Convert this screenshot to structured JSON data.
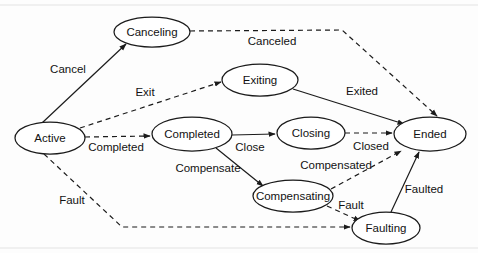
{
  "diagram": {
    "type": "state-machine",
    "background_color": "#fdfdfd",
    "stroke_color": "#1b1b1b",
    "text_color": "#121212",
    "nodes": [
      {
        "id": "active",
        "label": "Active",
        "cx": 50,
        "cy": 138,
        "rx": 35,
        "ry": 16
      },
      {
        "id": "canceling",
        "label": "Canceling",
        "cx": 152,
        "cy": 32,
        "rx": 38,
        "ry": 15
      },
      {
        "id": "exiting",
        "label": "Exiting",
        "cx": 260,
        "cy": 80,
        "rx": 38,
        "ry": 16
      },
      {
        "id": "completed",
        "label": "Completed",
        "cx": 192,
        "cy": 134,
        "rx": 40,
        "ry": 17
      },
      {
        "id": "closing",
        "label": "Closing",
        "cx": 311,
        "cy": 133,
        "rx": 34,
        "ry": 16
      },
      {
        "id": "ended",
        "label": "Ended",
        "cx": 430,
        "cy": 134,
        "rx": 36,
        "ry": 17
      },
      {
        "id": "compensating",
        "label": "Compensating",
        "cx": 293,
        "cy": 196,
        "rx": 40,
        "ry": 16
      },
      {
        "id": "faulting",
        "label": "Faulting",
        "cx": 386,
        "cy": 228,
        "rx": 34,
        "ry": 16
      }
    ],
    "edges": [
      {
        "id": "cancel",
        "label": "Cancel",
        "from": "active",
        "to": "canceling",
        "style": "solid",
        "label_x": 68,
        "label_y": 70
      },
      {
        "id": "canceled",
        "label": "Canceled",
        "from": "canceling",
        "to": "ended",
        "style": "dashed",
        "label_x": 272,
        "label_y": 42
      },
      {
        "id": "exit",
        "label": "Exit",
        "from": "active",
        "to": "exiting",
        "style": "dashed",
        "label_x": 145,
        "label_y": 93
      },
      {
        "id": "exited",
        "label": "Exited",
        "from": "exiting",
        "to": "ended",
        "style": "solid",
        "label_x": 362,
        "label_y": 92
      },
      {
        "id": "completed",
        "label": "Completed",
        "from": "active",
        "to": "completed",
        "style": "dashed",
        "label_x": 116,
        "label_y": 148
      },
      {
        "id": "close",
        "label": "Close",
        "from": "completed",
        "to": "closing",
        "style": "solid",
        "label_x": 250,
        "label_y": 148
      },
      {
        "id": "closed",
        "label": "Closed",
        "from": "closing",
        "to": "ended",
        "style": "dashed",
        "label_x": 371,
        "label_y": 147
      },
      {
        "id": "compensate",
        "label": "Compensate",
        "from": "completed",
        "to": "compensating",
        "style": "solid",
        "label_x": 208,
        "label_y": 169
      },
      {
        "id": "compensated",
        "label": "Compensated",
        "from": "compensating",
        "to": "ended",
        "style": "dashed",
        "label_x": 336,
        "label_y": 166
      },
      {
        "id": "fault_active",
        "label": "Fault",
        "from": "active",
        "to": "faulting",
        "style": "dashed",
        "label_x": 72,
        "label_y": 201
      },
      {
        "id": "fault_comp",
        "label": "Fault",
        "from": "compensating",
        "to": "faulting",
        "style": "dashed",
        "label_x": 351,
        "label_y": 206
      },
      {
        "id": "faulted",
        "label": "Faulted",
        "from": "faulting",
        "to": "ended",
        "style": "solid",
        "label_x": 424,
        "label_y": 190
      }
    ]
  }
}
